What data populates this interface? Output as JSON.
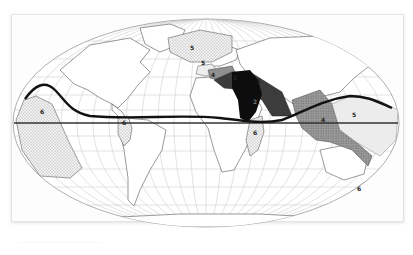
{
  "map": {
    "projection": "Mollweide",
    "style": "scanned grayscale figure",
    "colors": {
      "background": "#ffffff",
      "land_outline": "#555555",
      "graticule": "#b8b8b8",
      "boundary_line": "#111111",
      "equator_line": "#333333",
      "zone_1": "#0d0d0d",
      "zone_2": "#3a3a3a",
      "zone_4": "#8a8a8a",
      "zone_5": "#e6e6e6",
      "zone_6": "#d0d0d0"
    },
    "zones": [
      {
        "id": "zone-1",
        "label": "1",
        "region": "Arabian Peninsula / Middle East",
        "pattern": "solid black"
      },
      {
        "id": "zone-2",
        "label": "2",
        "region": "Iran / Mesopotamia",
        "pattern": "dark gray"
      },
      {
        "id": "zone-3",
        "label": "3",
        "region": "India",
        "pattern": "medium gray"
      },
      {
        "id": "zone-4",
        "label": "4",
        "region": "Southeast Asia / Indonesia",
        "pattern": "stippled gray"
      },
      {
        "id": "zone-5-atlantic",
        "label": "5",
        "region": "North Atlantic",
        "pattern": "dotted"
      },
      {
        "id": "zone-5-med",
        "label": "5",
        "region": "Mediterranean",
        "pattern": "light"
      },
      {
        "id": "zone-5-pacific",
        "label": "5",
        "region": "Western Pacific",
        "pattern": "light"
      },
      {
        "id": "zone-6-pacific",
        "label": "6",
        "region": "Eastern Pacific",
        "pattern": "dotted"
      },
      {
        "id": "zone-6-brazil",
        "label": "6",
        "region": "Brazil coast",
        "pattern": "dotted"
      },
      {
        "id": "zone-6-africa",
        "label": "6",
        "region": "East Africa / Madagascar",
        "pattern": "dotted"
      },
      {
        "id": "zone-6-nz",
        "label": "6",
        "region": "New Zealand",
        "pattern": "dotted"
      }
    ],
    "lines": [
      {
        "id": "equator",
        "description": "straight horizontal reference line"
      },
      {
        "id": "boundary-curve",
        "description": "thick wavy boundary line"
      }
    ]
  },
  "caption": "..........................................."
}
